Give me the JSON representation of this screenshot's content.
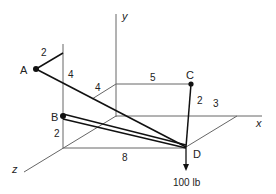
{
  "diagram": {
    "axes": {
      "x_label": "x",
      "y_label": "y",
      "z_label": "z"
    },
    "points": {
      "A": "A",
      "B": "B",
      "C": "C",
      "D": "D"
    },
    "dimensions": {
      "A_offset": "2",
      "A_height": "4",
      "top_depth": "4",
      "top_length": "5",
      "C_drop": "2",
      "x_offset": "3",
      "B_height": "2",
      "bottom_length": "8"
    },
    "load": {
      "label": "100 lb"
    },
    "colors": {
      "line": "#555555",
      "member": "#111111",
      "text": "#222222"
    }
  }
}
